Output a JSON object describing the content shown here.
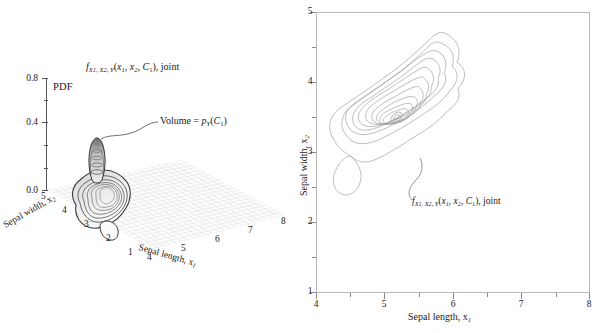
{
  "figure": {
    "background": "#ffffff",
    "ink": "#1a1a1a",
    "grid_color": "#d8d8d8",
    "contour_color": "#7a7a7a",
    "axis_color": "#8a8a8a"
  },
  "left_panel": {
    "name": "three-dimensional-joint-pdf-surface",
    "title": {
      "f": "f",
      "sub": "X1, X2, Y",
      "args": "(x",
      "arg1sub": "1",
      "argmid": ", x",
      "arg2sub": "2",
      "argmid2": ", C",
      "arg3sub": "1",
      "tail": "), joint",
      "plain": "f_X1,X2,Y(x1, x2, C1), joint"
    },
    "z_axis": {
      "label": "PDF",
      "ticks": [
        "0.8",
        "0.4",
        "0.0"
      ],
      "tick_values": [
        0.8,
        0.4,
        0.0
      ],
      "range": [
        0.0,
        1.0
      ],
      "minor_ticks": 5
    },
    "x_axis": {
      "name_prefix": "Sepal length, x",
      "name_sub": "1",
      "ticks": [
        "4",
        "5",
        "6",
        "7",
        "8"
      ],
      "range": [
        4,
        8
      ]
    },
    "y_axis": {
      "name_prefix": "Sepal width, x",
      "name_sub": "2",
      "ticks": [
        "5",
        "4",
        "3",
        "2",
        "1"
      ],
      "range": [
        1,
        5
      ]
    },
    "annotation": {
      "prefix": "Volume = ",
      "p": "p",
      "psub": "Y",
      "open": "(C",
      "csub": "1",
      "close": ")",
      "plain": "Volume = p_Y(C1)"
    }
  },
  "right_panel": {
    "name": "two-dimensional-joint-pdf-contour",
    "x_axis": {
      "name_prefix": "Sepal length, x",
      "name_sub": "1",
      "ticks": [
        "4",
        "5",
        "6",
        "7",
        "8"
      ],
      "tick_values": [
        4,
        5,
        6,
        7,
        8
      ],
      "range": [
        4,
        8
      ]
    },
    "y_axis": {
      "name_prefix": "Sepal width, x",
      "name_sub": "2",
      "ticks": [
        "5",
        "4",
        "3",
        "2",
        "1"
      ],
      "tick_values": [
        5,
        4,
        3,
        2,
        1
      ],
      "range": [
        1,
        5
      ]
    },
    "annotation": {
      "f": "f",
      "sub": "X1, X2, Y",
      "args": "(x",
      "arg1sub": "1",
      "argmid": ", x",
      "arg2sub": "2",
      "argmid2": ", C",
      "arg3sub": "1",
      "tail": "), joint",
      "plain": "f_X1,X2,Y(x1, x2, C1), joint"
    }
  },
  "chart_data": {
    "type": "contour",
    "xlabel": "Sepal length, x1",
    "ylabel": "Sepal width, x2",
    "xlim": [
      4,
      8
    ],
    "ylim": [
      1,
      5
    ],
    "zlabel": "PDF",
    "zlim": [
      0.0,
      1.0
    ],
    "grid": false,
    "legend": "none",
    "distribution": {
      "peak_x": 5.05,
      "peak_y": 3.4,
      "peak_pdf": 0.82,
      "orientation_deg": 45,
      "major_extent_x": [
        4.15,
        6.05
      ],
      "major_extent_y": [
        2.6,
        4.65
      ],
      "tail_lobe_x": [
        4.3,
        4.9
      ],
      "tail_lobe_y": [
        2.1,
        2.7
      ]
    },
    "contour_levels": [
      0.05,
      0.12,
      0.2,
      0.28,
      0.36,
      0.44,
      0.52,
      0.6,
      0.68,
      0.76
    ],
    "n_contours": 10
  }
}
